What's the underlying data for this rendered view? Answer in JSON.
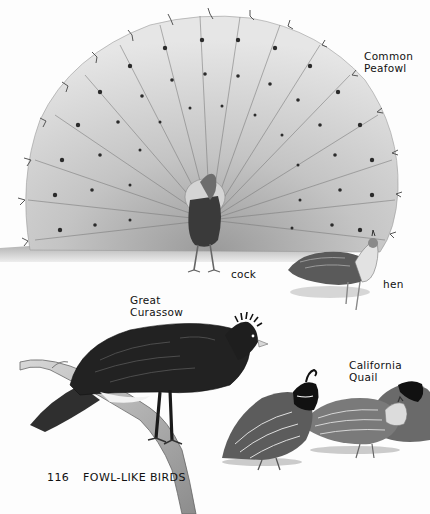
{
  "page": {
    "number": "116",
    "section_title": "FOWL-LIKE BIRDS"
  },
  "species": [
    {
      "name_line1": "Common",
      "name_line2": "Peafowl",
      "figures": [
        {
          "label": "cock"
        },
        {
          "label": "hen"
        }
      ]
    },
    {
      "name_line1": "Great",
      "name_line2": "Curassow"
    },
    {
      "name_line1": "California",
      "name_line2": "Quail"
    }
  ],
  "colors": {
    "paper": "#fdfdfd",
    "ink": "#111111",
    "mid_gray": "#8a8a8a",
    "light_gray": "#cfcfcf",
    "dark_plumage": "#2a2a2a"
  }
}
